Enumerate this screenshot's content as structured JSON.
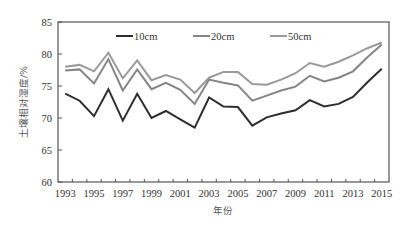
{
  "chart_data": {
    "type": "line",
    "title": "",
    "xlabel": "年份",
    "ylabel": "土壤相对湿度/%",
    "ylim": [
      60,
      85
    ],
    "yticks": [
      60,
      65,
      70,
      75,
      80,
      85
    ],
    "xtick_labels": [
      "1993",
      "1995",
      "1997",
      "1999",
      "2001",
      "2003",
      "2005",
      "2007",
      "2009",
      "2011",
      "2013",
      "2015"
    ],
    "grid": false,
    "legend_position": "top-inside",
    "x": [
      1993,
      1994,
      1995,
      1996,
      1997,
      1998,
      1999,
      2000,
      2001,
      2002,
      2003,
      2004,
      2005,
      2006,
      2007,
      2008,
      2009,
      2010,
      2011,
      2012,
      2013,
      2014,
      2015
    ],
    "series": [
      {
        "name": "10cm",
        "color": "#2e2e2e",
        "values": [
          73.8,
          72.7,
          70.3,
          74.5,
          69.6,
          73.8,
          70.0,
          71.1,
          69.8,
          68.5,
          73.2,
          71.8,
          71.7,
          68.8,
          70.1,
          70.7,
          71.2,
          72.8,
          71.8,
          72.2,
          73.3,
          75.6,
          77.7
        ]
      },
      {
        "name": "20cm",
        "color": "#858585",
        "values": [
          77.4,
          77.6,
          75.4,
          79.2,
          74.3,
          77.6,
          74.5,
          75.5,
          74.4,
          72.2,
          76.0,
          75.5,
          75.1,
          72.7,
          73.5,
          74.3,
          74.9,
          76.6,
          75.7,
          76.3,
          77.3,
          79.5,
          81.5
        ]
      },
      {
        "name": "50cm",
        "color": "#9a9a9a",
        "values": [
          78.0,
          78.3,
          77.3,
          80.2,
          76.2,
          79.0,
          75.9,
          76.7,
          76.0,
          73.9,
          76.3,
          77.2,
          77.2,
          75.3,
          75.2,
          76.0,
          77.0,
          78.6,
          78.0,
          78.8,
          79.8,
          80.9,
          81.8
        ]
      }
    ]
  }
}
